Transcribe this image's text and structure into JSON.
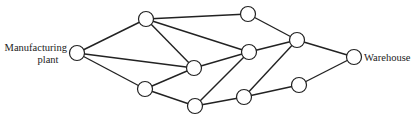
{
  "diagram": {
    "type": "network",
    "labels": {
      "source_line1": "Manufacturing",
      "source_line2": "plant",
      "sink": "Warehouse"
    },
    "nodes": [
      {
        "id": "P",
        "x": 77,
        "y": 53,
        "role": "source"
      },
      {
        "id": "A",
        "x": 146,
        "y": 19
      },
      {
        "id": "B",
        "x": 145,
        "y": 89
      },
      {
        "id": "C",
        "x": 194,
        "y": 68
      },
      {
        "id": "D",
        "x": 195,
        "y": 106
      },
      {
        "id": "E",
        "x": 248,
        "y": 14
      },
      {
        "id": "F",
        "x": 249,
        "y": 52
      },
      {
        "id": "G",
        "x": 244,
        "y": 97
      },
      {
        "id": "H",
        "x": 297,
        "y": 40
      },
      {
        "id": "I",
        "x": 299,
        "y": 85
      },
      {
        "id": "W",
        "x": 354,
        "y": 57,
        "role": "sink"
      }
    ],
    "edges": [
      [
        "P",
        "A"
      ],
      [
        "P",
        "C"
      ],
      [
        "P",
        "B"
      ],
      [
        "A",
        "E"
      ],
      [
        "A",
        "F"
      ],
      [
        "A",
        "C"
      ],
      [
        "B",
        "C"
      ],
      [
        "B",
        "D"
      ],
      [
        "C",
        "F"
      ],
      [
        "D",
        "F"
      ],
      [
        "D",
        "G"
      ],
      [
        "E",
        "H"
      ],
      [
        "F",
        "H"
      ],
      [
        "G",
        "H"
      ],
      [
        "G",
        "I"
      ],
      [
        "H",
        "W"
      ],
      [
        "I",
        "W"
      ]
    ],
    "node_radius": 7.5,
    "colors": {
      "stroke": "#222222",
      "fill": "#ffffff",
      "background": "#ffffff"
    }
  }
}
